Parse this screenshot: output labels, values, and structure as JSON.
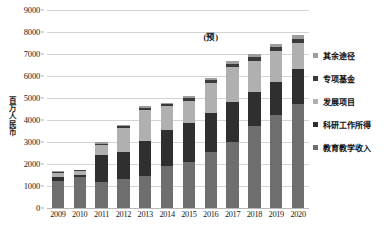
{
  "chart_data": {
    "type": "bar",
    "stacked": true,
    "title": "",
    "xlabel": "",
    "ylabel": "百万人民币",
    "ylim": [
      0,
      9000
    ],
    "yticks": [
      0,
      1000,
      2000,
      3000,
      4000,
      5000,
      6000,
      7000,
      8000,
      9000
    ],
    "grid": true,
    "legend_position": "right",
    "categories": [
      "2009",
      "2010",
      "2011",
      "2012",
      "2013",
      "2014",
      "2015",
      "2016",
      "2017",
      "2018",
      "2019",
      "2020"
    ],
    "series": [
      {
        "name": "教育教学收入",
        "color": "#6e6e6e",
        "values": [
          1230,
          1420,
          1170,
          1310,
          1450,
          1900,
          2080,
          2550,
          3020,
          3750,
          4230,
          4720
        ]
      },
      {
        "name": "科研工作所得",
        "color": "#2f2f2f",
        "values": [
          190,
          80,
          1220,
          1250,
          1600,
          1660,
          1790,
          1750,
          1800,
          1530,
          1520,
          1590
        ]
      },
      {
        "name": "发展项目",
        "color": "#b0b0b0",
        "values": [
          175,
          170,
          460,
          1100,
          1420,
          1070,
          1010,
          1390,
          1570,
          1410,
          1380,
          1200
        ]
      },
      {
        "name": "专项基金",
        "color": "#3a3a3a",
        "values": [
          60,
          40,
          60,
          70,
          80,
          90,
          110,
          130,
          150,
          160,
          170,
          180
        ]
      },
      {
        "name": "其余途径",
        "color": "#9d9d9d",
        "values": [
          45,
          40,
          80,
          60,
          90,
          70,
          100,
          110,
          140,
          160,
          170,
          160
        ]
      }
    ],
    "totals": [
      1700,
      1750,
      2990,
      3790,
      4640,
      4790,
      5090,
      5930,
      6680,
      7010,
      7470,
      7850
    ],
    "annotations": [
      {
        "text": "(预)",
        "x_category": "2016",
        "y_value": 7800
      }
    ]
  },
  "legend": {
    "items": [
      {
        "label": "其余途径",
        "color": "#9d9d9d"
      },
      {
        "label": "专项基金",
        "color": "#3a3a3a"
      },
      {
        "label": "发展项目",
        "color": "#b0b0b0"
      },
      {
        "label": "科研工作所得",
        "color": "#2f2f2f"
      },
      {
        "label": "教育教学收入",
        "color": "#6e6e6e"
      }
    ]
  }
}
